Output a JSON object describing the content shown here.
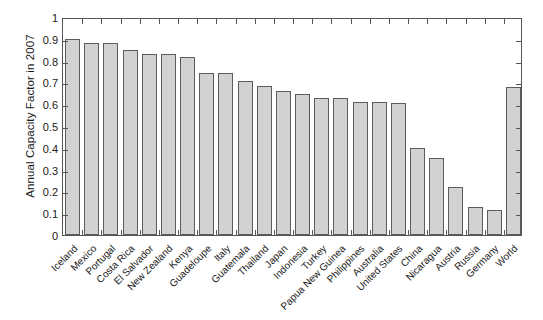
{
  "chart_data": {
    "type": "bar",
    "title": "",
    "xlabel": "",
    "ylabel": "Annual Capacity Factor in 2007",
    "ylim": [
      0,
      1
    ],
    "yticks": [
      "0",
      "0.1",
      "0.2",
      "0.3",
      "0.4",
      "0.5",
      "0.6",
      "0.7",
      "0.8",
      "0.9",
      "1"
    ],
    "grid": false,
    "legend": null,
    "bar_fill_color": "#d2d2d2",
    "bar_edge_color": "#5c5c5c",
    "axis_color": "#555555",
    "categories": [
      "Iceland",
      "Mexico",
      "Portugal",
      "Costa Rica",
      "El Salvador",
      "New Zealand",
      "Kenya",
      "Guadeloupe",
      "Italy",
      "Guatemala",
      "Thailand",
      "Japan",
      "Indonesia",
      "Turkey",
      "Papua New Guinea",
      "Philippines",
      "Australia",
      "United States",
      "China",
      "Nicaragua",
      "Austria",
      "Russia",
      "Germany",
      "World"
    ],
    "values": [
      0.9,
      0.88,
      0.88,
      0.85,
      0.83,
      0.83,
      0.815,
      0.745,
      0.745,
      0.705,
      0.685,
      0.66,
      0.645,
      0.63,
      0.63,
      0.61,
      0.61,
      0.605,
      0.4,
      0.355,
      0.22,
      0.13,
      0.115,
      0.68
    ]
  }
}
